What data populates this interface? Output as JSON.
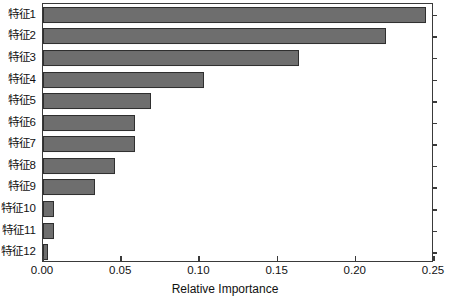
{
  "chart_data": {
    "type": "bar",
    "orientation": "horizontal",
    "title": "",
    "xlabel": "Relative Importance",
    "ylabel": "",
    "categories": [
      "特征1",
      "特征2",
      "特征3",
      "特征4",
      "特征5",
      "特征6",
      "特征7",
      "特征8",
      "特征9",
      "特征10",
      "特征11",
      "特征12"
    ],
    "values": [
      0.245,
      0.219,
      0.164,
      0.103,
      0.069,
      0.059,
      0.059,
      0.046,
      0.033,
      0.007,
      0.007,
      0.003
    ],
    "xlim": [
      0.0,
      0.25
    ],
    "xticks": [
      0.0,
      0.05,
      0.1,
      0.15,
      0.2,
      0.25
    ],
    "xtick_labels": [
      "0.00",
      "0.05",
      "0.10",
      "0.15",
      "0.20",
      "0.25"
    ],
    "grid": false,
    "legend": null,
    "bar_color": "#6e6e6e",
    "bar_edge_color": "#2f2f2f",
    "axis_color": "#3a3a3a",
    "background_color": "#ffffff"
  }
}
